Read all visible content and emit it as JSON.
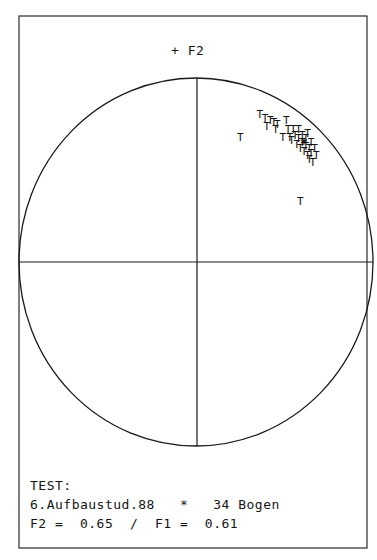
{
  "axis_label_top": "+ F2",
  "legend": {
    "line1": "TEST:",
    "line2": "6.Aufbaustud.88   *   34 Bogen",
    "line3": "F2 =  0.65  /  F1 =  0.61"
  },
  "colors": {
    "ink": "#151515",
    "background": "#ffffff"
  },
  "chart_data": {
    "type": "scatter",
    "subtitle": "34 Bogen",
    "xlabel": "F1",
    "ylabel": "F2",
    "xlim": [
      -1,
      1
    ],
    "ylim": [
      -1,
      1
    ],
    "grid": false,
    "unit_circle": true,
    "marker": "T",
    "centroid_marker": "*",
    "centroid": {
      "x": 0.61,
      "y": 0.65
    },
    "n_points": 34,
    "points": [
      {
        "x": 0.25,
        "y": 0.66
      },
      {
        "x": 0.36,
        "y": 0.78
      },
      {
        "x": 0.39,
        "y": 0.76
      },
      {
        "x": 0.4,
        "y": 0.72
      },
      {
        "x": 0.42,
        "y": 0.75
      },
      {
        "x": 0.44,
        "y": 0.74
      },
      {
        "x": 0.45,
        "y": 0.7
      },
      {
        "x": 0.46,
        "y": 0.73
      },
      {
        "x": 0.49,
        "y": 0.66
      },
      {
        "x": 0.51,
        "y": 0.75
      },
      {
        "x": 0.52,
        "y": 0.7
      },
      {
        "x": 0.53,
        "y": 0.66
      },
      {
        "x": 0.54,
        "y": 0.64
      },
      {
        "x": 0.55,
        "y": 0.7
      },
      {
        "x": 0.56,
        "y": 0.67
      },
      {
        "x": 0.57,
        "y": 0.62
      },
      {
        "x": 0.58,
        "y": 0.65
      },
      {
        "x": 0.58,
        "y": 0.7
      },
      {
        "x": 0.59,
        "y": 0.6
      },
      {
        "x": 0.6,
        "y": 0.67
      },
      {
        "x": 0.6,
        "y": 0.63
      },
      {
        "x": 0.61,
        "y": 0.58
      },
      {
        "x": 0.62,
        "y": 0.65
      },
      {
        "x": 0.62,
        "y": 0.61
      },
      {
        "x": 0.63,
        "y": 0.56
      },
      {
        "x": 0.63,
        "y": 0.68
      },
      {
        "x": 0.64,
        "y": 0.6
      },
      {
        "x": 0.64,
        "y": 0.54
      },
      {
        "x": 0.65,
        "y": 0.63
      },
      {
        "x": 0.65,
        "y": 0.57
      },
      {
        "x": 0.66,
        "y": 0.52
      },
      {
        "x": 0.67,
        "y": 0.6
      },
      {
        "x": 0.68,
        "y": 0.56
      },
      {
        "x": 0.59,
        "y": 0.31
      }
    ]
  }
}
